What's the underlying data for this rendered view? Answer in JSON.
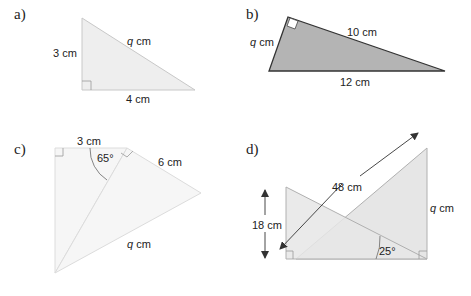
{
  "figures": [
    {
      "id": "a",
      "label": "a)",
      "type": "right-triangle",
      "sides": {
        "vertical": "3 cm",
        "horizontal": "4 cm",
        "hypotenuse": "q cm"
      },
      "unknown": "q",
      "fill": "#eeeeee",
      "stroke": "#c8c8c8"
    },
    {
      "id": "b",
      "label": "b)",
      "type": "right-triangle",
      "sides": {
        "short_leg": "q cm",
        "long_leg": "10 cm",
        "hypotenuse": "12 cm"
      },
      "unknown": "q",
      "fill": "#b4b4b4",
      "stroke": "#333333"
    },
    {
      "id": "c",
      "label": "c)",
      "type": "compound-right-triangles",
      "sides": {
        "top": "3 cm",
        "right": "6 cm",
        "diagonal": "q cm"
      },
      "angle": "65°",
      "unknown": "q",
      "fill": "#f6f6f6",
      "stroke": "#dcdcdc"
    },
    {
      "id": "d",
      "label": "d)",
      "type": "overlapping-right-triangles",
      "sides": {
        "left_height": "18 cm",
        "diagonal": "48 cm",
        "right_height": "q cm"
      },
      "angle": "25°",
      "unknown": "q",
      "fill": "#e6e6e6",
      "stroke": "#b0b0b0"
    }
  ],
  "a": {
    "label": "a)",
    "left": "3 cm",
    "bottom": "4 cm",
    "hyp_var": "q",
    "hyp_unit": " cm"
  },
  "b": {
    "label": "b)",
    "left_var": "q",
    "left_unit": " cm",
    "top": "10 cm",
    "bottom": "12 cm"
  },
  "c": {
    "label": "c)",
    "top": "3 cm",
    "angle": "65°",
    "right": "6 cm",
    "diag_var": "q",
    "diag_unit": " cm"
  },
  "d": {
    "label": "d)",
    "diag": "48 cm",
    "left": "18 cm",
    "right_var": "q",
    "right_unit": " cm",
    "angle": "25°"
  }
}
